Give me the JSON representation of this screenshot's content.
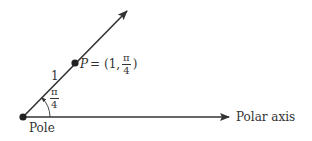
{
  "diagram": {
    "pole_label": "Pole",
    "axis_label": "Polar axis",
    "radius_label": "1",
    "angle_label": {
      "numerator": "π",
      "denominator": "4"
    },
    "point": {
      "name": "P",
      "equals": "= (1,",
      "angle_numerator": "π",
      "angle_denominator": "4",
      "close": ")"
    },
    "colors": {
      "line": "#333333",
      "text": "#333333",
      "background": "#ffffff"
    }
  }
}
